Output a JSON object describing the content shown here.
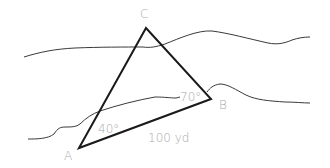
{
  "diagram": {
    "type": "triangulation across river",
    "vertices": {
      "A": {
        "label": "A"
      },
      "B": {
        "label": "B"
      },
      "C": {
        "label": "C"
      }
    },
    "angles": {
      "A": "40°",
      "B": "70°"
    },
    "side_AB": "100 yd",
    "colors": {
      "triangle": "#1a1a1a",
      "river_banks": "#3a3a3a",
      "labels": "#a8a8a8"
    }
  }
}
